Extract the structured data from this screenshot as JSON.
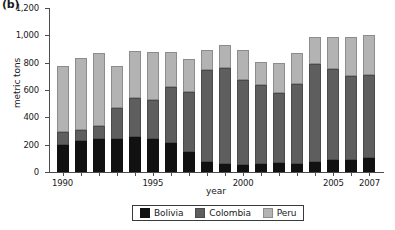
{
  "panel": {
    "letter": "(b)"
  },
  "chart_data": {
    "type": "bar",
    "stacked": true,
    "title": "",
    "xlabel": "year",
    "ylabel": "metric tons",
    "ylim": [
      0,
      1200
    ],
    "ytick_values": [
      0,
      200,
      400,
      600,
      800,
      1000,
      1200
    ],
    "ytick_labels": [
      "0",
      "200",
      "400",
      "600",
      "800",
      "1,000",
      "1,200"
    ],
    "grid": false,
    "legend_position": "bottom",
    "categories": [
      "1990",
      "1991",
      "1992",
      "1993",
      "1994",
      "1995",
      "1996",
      "1997",
      "1998",
      "1999",
      "2000",
      "2001",
      "2002",
      "2003",
      "2004",
      "2005",
      "2006",
      "2007"
    ],
    "xtick_labels": [
      "1990",
      "1995",
      "2000",
      "2005",
      "2007"
    ],
    "xtick_categories": [
      "1990",
      "1995",
      "2000",
      "2005",
      "2007"
    ],
    "series": [
      {
        "name": "Bolivia",
        "color": "#111111",
        "values": [
          200,
          225,
          245,
          240,
          255,
          240,
          215,
          150,
          70,
          60,
          50,
          60,
          65,
          60,
          75,
          85,
          85,
          105
        ]
      },
      {
        "name": "Colombia",
        "color": "#5e5e5e",
        "values": [
          95,
          85,
          95,
          230,
          285,
          290,
          405,
          435,
          680,
          700,
          620,
          580,
          510,
          585,
          715,
          670,
          615,
          605
        ]
      },
      {
        "name": "Peru",
        "color": "#b3b3b3",
        "values": [
          480,
          525,
          530,
          305,
          345,
          350,
          260,
          240,
          145,
          170,
          225,
          165,
          225,
          225,
          200,
          230,
          285,
          290
        ]
      }
    ],
    "totals": [
      775,
      835,
      870,
      775,
      885,
      880,
      880,
      825,
      895,
      930,
      895,
      805,
      800,
      870,
      990,
      985,
      985,
      1000
    ]
  }
}
